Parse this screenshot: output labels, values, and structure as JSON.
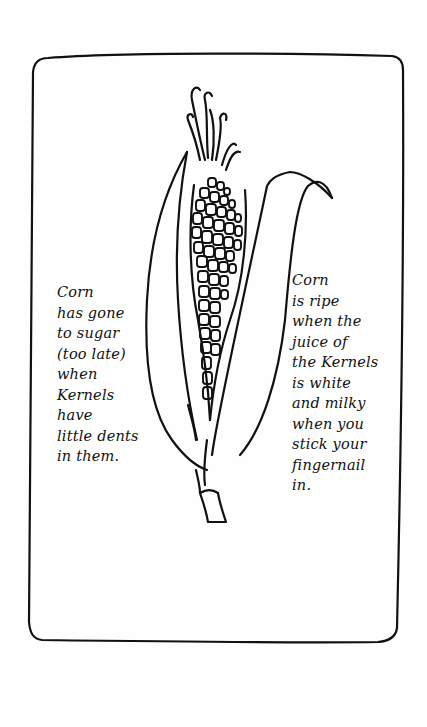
{
  "illustration": {
    "subject": "ear of corn with husk leaves and silk",
    "stroke_color": "#111111",
    "background_color": "#fefefe"
  },
  "notes": {
    "left": {
      "lines": [
        "Corn",
        "has gone",
        "to sugar",
        "(too late)",
        "when",
        "Kernels",
        "have",
        "little dents",
        "in them."
      ]
    },
    "right": {
      "lines": [
        "Corn",
        "is ripe",
        "when the",
        "juice of",
        "the Kernels",
        "is white",
        "and milky",
        "when you",
        "stick your",
        "fingernail",
        "in."
      ]
    }
  }
}
